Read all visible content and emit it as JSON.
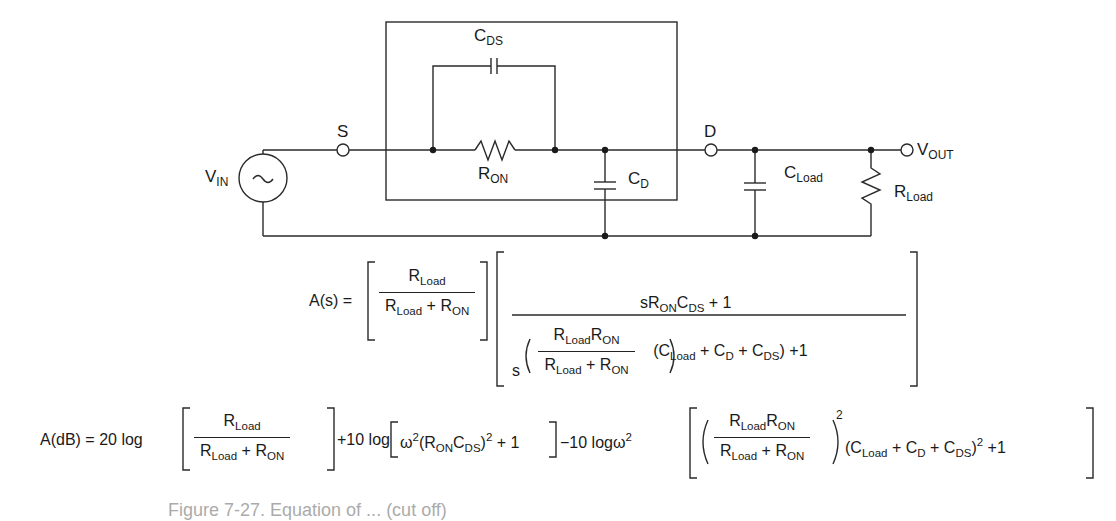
{
  "figure": {
    "type": "circuit-diagram-with-equations",
    "stroke_color": "#2a2a2a",
    "background": "#ffffff"
  },
  "circuit": {
    "source": {
      "label": "V",
      "sub": "IN",
      "symbol": "~"
    },
    "terminals": [
      {
        "label": "S"
      },
      {
        "label": "D"
      }
    ],
    "output": {
      "label": "V",
      "sub": "OUT"
    },
    "components": {
      "cds": {
        "label": "C",
        "sub": "DS"
      },
      "ron": {
        "label": "R",
        "sub": "ON"
      },
      "cd": {
        "label": "C",
        "sub": "D"
      },
      "cload": {
        "label": "C",
        "sub": "Load"
      },
      "rload": {
        "label": "R",
        "sub": "Load"
      }
    }
  },
  "equations": {
    "as": {
      "lhs": "A(s) =",
      "term1_num": "R_Load",
      "term1_den": "R_Load + R_ON",
      "term2_num": "sR_ON C_DS + 1",
      "term2_den": "s(R_Load R_ON / (R_Load + R_ON))(C_Load + C_D + C_DS) + 1"
    },
    "adb": {
      "lhs": "A(dB) = 20 log",
      "part2": "+10 log",
      "part2_body": "ω²(R_ON C_DS)² + 1",
      "part3": "−10 logω²",
      "part3_body": "(R_Load R_ON / (R_Load + R_ON))² (C_Load + C_D + C_DS)² + 1"
    },
    "text": {
      "R": "R",
      "C": "C",
      "Load": "Load",
      "ON": "ON",
      "DS": "DS",
      "D": "D",
      "plus": "+",
      "plus1": "+ 1",
      "s": "s",
      "two": "2",
      "one": "1",
      "eq_as": "A(s) =",
      "eq_db": "A(dB) = 20 log",
      "ten_log": "+10 log",
      "minus_ten_log": "−10 logω",
      "omega": "ω",
      "lparen": "(",
      "rparen": ")"
    }
  },
  "caption": {
    "text": "Figure 7-27. Equation of ... (cut off)"
  }
}
